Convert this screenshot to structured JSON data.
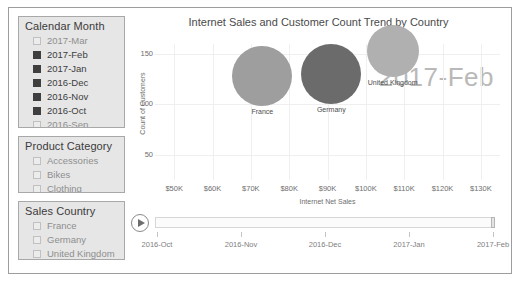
{
  "slicers": [
    {
      "id": "calendar-month",
      "title": "Calendar Month",
      "items": [
        {
          "label": "2017-Mar",
          "checked": false,
          "faded": true
        },
        {
          "label": "2017-Feb",
          "checked": true,
          "faded": false
        },
        {
          "label": "2017-Jan",
          "checked": true,
          "faded": false
        },
        {
          "label": "2016-Dec",
          "checked": true,
          "faded": false
        },
        {
          "label": "2016-Nov",
          "checked": true,
          "faded": false
        },
        {
          "label": "2016-Oct",
          "checked": true,
          "faded": false
        },
        {
          "label": "2016-Sep",
          "checked": true,
          "faded": true
        }
      ]
    },
    {
      "id": "product-category",
      "title": "Product Category",
      "items": [
        {
          "label": "Accessories",
          "checked": false,
          "faded": true
        },
        {
          "label": "Bikes",
          "checked": false,
          "faded": true
        },
        {
          "label": "Clothing",
          "checked": false,
          "faded": true
        }
      ]
    },
    {
      "id": "sales-country",
      "title": "Sales Country",
      "items": [
        {
          "label": "France",
          "checked": false,
          "faded": true
        },
        {
          "label": "Germany",
          "checked": false,
          "faded": true
        },
        {
          "label": "United Kingdom",
          "checked": false,
          "faded": true
        }
      ]
    }
  ],
  "chart_data": {
    "type": "scatter",
    "title": "Internet Sales and Customer Count Trend by Country",
    "xlabel": "Internet Net Sales",
    "ylabel": "Count of Customers",
    "xlim": [
      45000,
      135000
    ],
    "ylim": [
      25,
      160
    ],
    "xticks": [
      "$50K",
      "$60K",
      "$70K",
      "$80K",
      "$90K",
      "$100K",
      "$110K",
      "$120K",
      "$130K"
    ],
    "xtick_values": [
      50000,
      60000,
      70000,
      80000,
      90000,
      100000,
      110000,
      120000,
      130000
    ],
    "yticks": [
      "150",
      "100",
      "50"
    ],
    "ytick_values": [
      150,
      100,
      50
    ],
    "grid": true,
    "legend": "none",
    "period_watermark": "2017-Feb",
    "points": [
      {
        "name": "France",
        "x": 73000,
        "y": 128,
        "size": 30,
        "color": "#9e9e9e"
      },
      {
        "name": "Germany",
        "x": 91000,
        "y": 130,
        "size": 30,
        "color": "#6b6b6b"
      },
      {
        "name": "United Kingdom",
        "x": 107000,
        "y": 153,
        "size": 26,
        "color": "#b0b0b0"
      }
    ]
  },
  "play_axis": {
    "play_button_label": "Play",
    "current_value": "2017-Feb",
    "ticks": [
      "2016-Oct",
      "2016-Nov",
      "2016-Dec",
      "2017-Jan",
      "2017-Feb"
    ]
  }
}
